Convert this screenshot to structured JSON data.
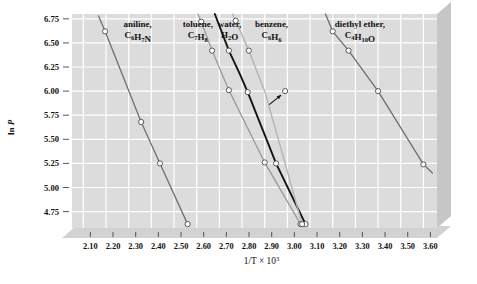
{
  "chart_data": {
    "type": "line",
    "title": "",
    "subtitle": "",
    "xlabel": "1/T × 10³",
    "ylabel": "ln P",
    "xlim": [
      2.05,
      3.66
    ],
    "ylim": [
      4.58,
      6.8
    ],
    "grid": true,
    "legend_position": "inline-above-lines",
    "xticks": [
      "2.10",
      "2.20",
      "2.30",
      "2.40",
      "2.50",
      "2.60",
      "2.70",
      "2.80",
      "2.90",
      "3.00",
      "3.10",
      "3.20",
      "3.30",
      "3.40",
      "3.50",
      "3.60"
    ],
    "xtick_values": [
      2.1,
      2.2,
      2.3,
      2.4,
      2.5,
      2.6,
      2.7,
      2.8,
      2.9,
      3.0,
      3.1,
      3.2,
      3.3,
      3.4,
      3.5,
      3.6
    ],
    "yticks": [
      "4.75",
      "5.00",
      "5.25",
      "5.50",
      "5.75",
      "6.00",
      "6.25",
      "6.50",
      "6.75"
    ],
    "ytick_values": [
      4.75,
      5.0,
      5.25,
      5.5,
      5.75,
      6.0,
      6.25,
      6.5,
      6.75
    ],
    "annotations": [
      {
        "name": "arrow-to-benzene-point",
        "text": "",
        "points_to_x": 2.99,
        "points_to_y": 6.0,
        "tail_x": 2.92,
        "tail_y": 5.86
      }
    ],
    "series": [
      {
        "name": "aniline",
        "label_line1": "aniline,",
        "label_line2": "C₆H₇N",
        "formula": "C6H7N",
        "color": "#707070",
        "width": 1.3,
        "label_x": 2.34,
        "label_y": 6.66,
        "x": [
          2.167,
          2.196,
          2.355,
          2.438,
          2.56
        ],
        "y": [
          6.78,
          6.62,
          5.68,
          5.25,
          4.62
        ],
        "markers_x": [
          2.196,
          2.355,
          2.438,
          2.56
        ],
        "markers_y": [
          6.62,
          5.68,
          5.25,
          4.62
        ]
      },
      {
        "name": "toluene",
        "label_line1": "toluene,",
        "label_line2": "C₇H₈",
        "formula": "C7H8",
        "color": "#9a9a9a",
        "width": 1.3,
        "label_x": 2.605,
        "label_y": 6.66,
        "x": [
          2.605,
          2.62,
          2.668,
          2.742,
          2.9,
          3.058
        ],
        "y": [
          6.8,
          6.72,
          6.42,
          6.01,
          5.26,
          4.62
        ],
        "markers_x": [
          2.62,
          2.668,
          2.742,
          2.9,
          3.058
        ],
        "markers_y": [
          6.72,
          6.42,
          6.01,
          5.26,
          4.62
        ]
      },
      {
        "name": "water",
        "label_line1": "water,",
        "label_line2": "H₂O",
        "formula": "H2O",
        "color": "#141414",
        "width": 1.9,
        "label_x": 2.745,
        "label_y": 6.66,
        "x": [
          2.68,
          2.742,
          2.79,
          2.825,
          2.95,
          3.08
        ],
        "y": [
          6.8,
          6.42,
          6.18,
          5.99,
          5.25,
          4.62
        ],
        "markers_x": [
          2.742,
          2.825,
          2.95,
          3.08
        ],
        "markers_y": [
          6.42,
          5.99,
          5.25,
          4.62
        ]
      },
      {
        "name": "benzene",
        "label_line1": "benzene,",
        "label_line2": "C₆H₆",
        "formula": "C6H6",
        "color": "#b4b4b4",
        "width": 1.4,
        "label_x": 2.93,
        "label_y": 6.66,
        "x": [
          2.758,
          2.772,
          2.83,
          2.9,
          2.99,
          3.065
        ],
        "y": [
          6.8,
          6.73,
          6.42,
          6.0,
          5.25,
          4.62
        ],
        "markers_x": [
          2.772,
          2.83,
          2.99,
          3.065
        ],
        "markers_y": [
          6.73,
          6.42,
          6.0,
          4.62
        ]
      },
      {
        "name": "diethyl-ether",
        "label_line1": "diethyl ether,",
        "label_line2": "C₄H₁₀O",
        "formula": "C4H10O",
        "color": "#6e6e6e",
        "width": 1.3,
        "label_x": 3.32,
        "label_y": 6.66,
        "x": [
          3.168,
          3.2,
          3.27,
          3.4,
          3.6,
          3.64
        ],
        "y": [
          6.8,
          6.62,
          6.42,
          6.0,
          5.24,
          5.15
        ],
        "markers_x": [
          3.2,
          3.27,
          3.4,
          3.6
        ],
        "markers_y": [
          6.62,
          6.42,
          6.0,
          5.24
        ]
      }
    ]
  },
  "figure": {
    "plot_bg": "#dcdcdc",
    "grid_color": "#ffffff",
    "panel_side_color": "#c6c6c6",
    "panel_bottom_color": "#d2d2d2",
    "marker_fill": "#ffffff",
    "marker_stroke": "#4a4a4a",
    "tick_color": "#555555",
    "text_color": "#111111"
  }
}
